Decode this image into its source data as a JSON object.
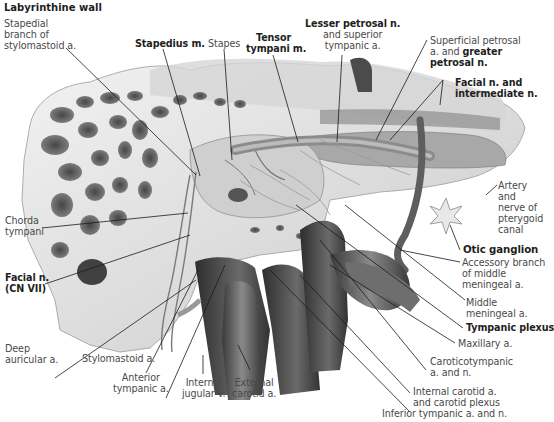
{
  "figure": {
    "title": "Labyrinthine wall",
    "background": "#ffffff",
    "illustration": "grayscale medial view of tympanic cavity labyrinthine wall with vessels and nerves",
    "colors": {
      "bone_light": "#ececec",
      "bone_mid": "#b5b5b5",
      "bone_dark": "#3e3e3e",
      "vessel": "#555555",
      "leader": "#1a1a1a",
      "label_plain": "#4a4a4a",
      "label_bold": "#1e1e1e"
    }
  },
  "labels": {
    "stapedial_branch": [
      "Stapedial",
      "branch of",
      "stylomastoid a."
    ],
    "stapedius": "Stapedius m.",
    "stapes": "Stapes",
    "tensor_tympani": [
      "Tensor",
      "tympani m."
    ],
    "lesser_petrosal": {
      "bold": "Lesser petrosal n.",
      "rest": [
        "and superior",
        "tympanic a."
      ]
    },
    "superficial_petrosal": {
      "line1": "Superficial petrosal",
      "line2_plain": "a. and ",
      "line2_bold": "greater",
      "line3_bold": "petrosal n."
    },
    "facial_intermediate": [
      "Facial n. and",
      "intermediate n."
    ],
    "artery_pterygoid": [
      "Artery",
      "and",
      "nerve of",
      "pterygoid",
      "canal"
    ],
    "otic_ganglion": "Otic ganglion",
    "accessory_branch": [
      "Accessory branch",
      "of middle",
      "meningeal a."
    ],
    "middle_meningeal": [
      "Middle",
      "meningeal a."
    ],
    "tympanic_plexus": "Tympanic plexus",
    "maxillary": "Maxillary a.",
    "caroticotympanic": [
      "Caroticotympanic",
      "a. and n."
    ],
    "internal_carotid": [
      "Internal carotid a.",
      "and carotid plexus"
    ],
    "inferior_tympanic": "Inferior tympanic a. and n.",
    "external_carotid": [
      "External",
      "carotid a."
    ],
    "internal_jugular": [
      "Internal",
      "jugular v."
    ],
    "anterior_tympanic": [
      "Anterior",
      "tympanic a."
    ],
    "stylomastoid": "Stylomastoid a.",
    "deep_auricular": [
      "Deep",
      "auricular a."
    ],
    "facial_n": [
      "Facial n.",
      "(CN VII)"
    ],
    "chorda_tympani": [
      "Chorda",
      "tympani"
    ]
  }
}
